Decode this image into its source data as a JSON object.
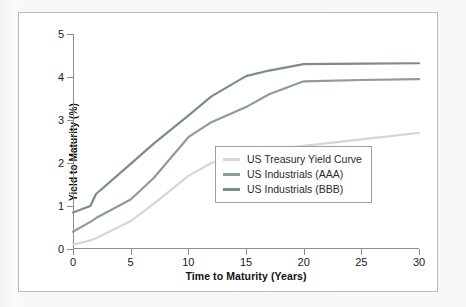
{
  "chart_data": {
    "type": "line",
    "title": "",
    "xlabel": "Time to Maturity (Years)",
    "ylabel": "Yield to Maturity (%)",
    "xlim": [
      0,
      30
    ],
    "ylim": [
      0,
      5
    ],
    "xticks": [
      "0",
      "5",
      "10",
      "15",
      "20",
      "25",
      "30"
    ],
    "yticks": [
      "0",
      "1",
      "2",
      "3",
      "4",
      "5"
    ],
    "grid": false,
    "legend_position": "lower right",
    "series": [
      {
        "name": "US Treasury Yield Curve",
        "color": "#d5d6d6",
        "x": [
          0,
          1.5,
          2,
          5,
          7,
          10,
          12,
          15,
          17,
          20,
          25,
          30
        ],
        "values": [
          0.1,
          0.2,
          0.25,
          0.65,
          1.05,
          1.7,
          2.0,
          2.25,
          2.3,
          2.4,
          2.55,
          2.7
        ]
      },
      {
        "name": "US Industrials (AAA)",
        "color": "#8c9aa4",
        "x": [
          0,
          1.5,
          2,
          5,
          7,
          10,
          12,
          15,
          17,
          20,
          25,
          30
        ],
        "values": [
          0.4,
          0.63,
          0.72,
          1.15,
          1.65,
          2.6,
          2.95,
          3.3,
          3.6,
          3.9,
          3.93,
          3.95
        ]
      },
      {
        "name": "US Industrials (BBB)",
        "color": "#7b8a93",
        "x": [
          0,
          1.5,
          2,
          5,
          7,
          10,
          12,
          15,
          17,
          20,
          25,
          30
        ],
        "values": [
          0.85,
          1.0,
          1.28,
          1.98,
          2.45,
          3.1,
          3.55,
          4.02,
          4.15,
          4.3,
          4.31,
          4.32
        ]
      }
    ]
  },
  "legend": {
    "entries": [
      {
        "label": "US Treasury Yield Curve",
        "color": "#d5d6d6"
      },
      {
        "label": "US Industrials (AAA)",
        "color": "#8c9aa4"
      },
      {
        "label": "US Industrials (BBB)",
        "color": "#7b8a93"
      }
    ]
  },
  "axes": {
    "x_title": "Time to Maturity (Years)",
    "y_title": "Yield to Maturity (%)",
    "x_tick_labels": [
      "0",
      "5",
      "10",
      "15",
      "20",
      "25",
      "30"
    ],
    "y_tick_labels": [
      "0",
      "1",
      "2",
      "3",
      "4",
      "5"
    ]
  },
  "colors": {
    "axis": "#8b8d8f",
    "card_border": "#b9bcbe",
    "page_background": "#f5f5f5",
    "text": "#1a1a1a"
  }
}
